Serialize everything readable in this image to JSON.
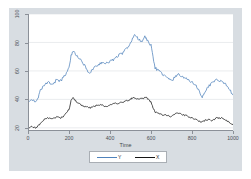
{
  "chart_data": {
    "type": "line",
    "title": "",
    "subtitle": "",
    "xlabel": "Time",
    "ylabel": "",
    "xlim": [
      0,
      1000
    ],
    "ylim": [
      20,
      100
    ],
    "grid": "horizontal",
    "legend_position": "bottom-center",
    "x_ticks": [
      "0",
      "200",
      "400",
      "600",
      "800",
      "1000"
    ],
    "x_tick_values": [
      0,
      200,
      400,
      600,
      800,
      1000
    ],
    "y_ticks": [
      "20",
      "40",
      "60",
      "80",
      "100"
    ],
    "y_tick_values": [
      20,
      40,
      60,
      80,
      100
    ],
    "series": [
      {
        "name": "Y",
        "color": "#4f82bb",
        "x": [
          0,
          20,
          40,
          50,
          60,
          80,
          100,
          120,
          140,
          160,
          180,
          200,
          210,
          220,
          240,
          260,
          280,
          300,
          310,
          320,
          340,
          360,
          380,
          400,
          420,
          440,
          460,
          480,
          500,
          510,
          520,
          530,
          540,
          560,
          570,
          580,
          600,
          610,
          620,
          640,
          660,
          680,
          700,
          720,
          730,
          740,
          760,
          780,
          800,
          820,
          840,
          850,
          860,
          870,
          880,
          900,
          920,
          940,
          960,
          980,
          1000
        ],
        "values": [
          39,
          40,
          38,
          41,
          46,
          50,
          52,
          50,
          54,
          53,
          57,
          62,
          71,
          74,
          70,
          67,
          63,
          58,
          60,
          62,
          64,
          66,
          65,
          67,
          68,
          71,
          72,
          76,
          79,
          83,
          85,
          84,
          82,
          81,
          84,
          82,
          78,
          70,
          62,
          60,
          57,
          55,
          53,
          56,
          58,
          57,
          55,
          54,
          52,
          50,
          44,
          42,
          44,
          47,
          49,
          52,
          54,
          53,
          51,
          48,
          43
        ]
      },
      {
        "name": "X",
        "color": "#151515",
        "x": [
          0,
          20,
          40,
          60,
          80,
          100,
          120,
          140,
          160,
          180,
          200,
          210,
          220,
          240,
          260,
          280,
          300,
          320,
          340,
          360,
          380,
          400,
          420,
          440,
          460,
          480,
          500,
          510,
          520,
          540,
          560,
          580,
          600,
          610,
          620,
          640,
          660,
          680,
          700,
          720,
          740,
          760,
          780,
          800,
          820,
          840,
          860,
          880,
          900,
          920,
          940,
          960,
          980,
          1000
        ],
        "values": [
          20,
          21,
          20,
          23,
          26,
          27,
          26,
          28,
          27,
          29,
          33,
          39,
          41,
          38,
          36,
          35,
          34,
          35,
          36,
          36,
          35,
          36,
          37,
          37,
          38,
          39,
          40,
          41,
          41,
          40,
          41,
          41,
          38,
          34,
          31,
          30,
          29,
          29,
          28,
          30,
          30,
          29,
          28,
          27,
          26,
          24,
          25,
          26,
          25,
          27,
          27,
          26,
          24,
          22
        ]
      }
    ]
  },
  "axes": {
    "x_title": "Time"
  },
  "legend": {
    "entries": [
      {
        "label": "Y",
        "key": "legend-line-y"
      },
      {
        "label": "X",
        "key": "legend-line-x"
      }
    ]
  },
  "colors": {
    "series_y": "#4f82bb",
    "series_x": "#151515",
    "graph_region": "#d8dde2",
    "plot_region": "#ffffff",
    "axis": "#8b9098",
    "gridline": "#e4e7ea"
  }
}
